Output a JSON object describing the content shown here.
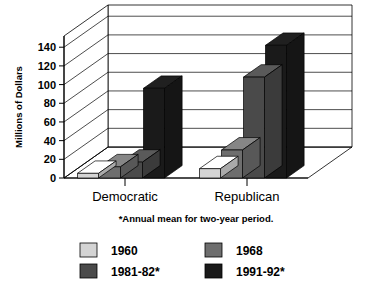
{
  "chart_data": {
    "type": "bar",
    "title": "",
    "subtitle": "",
    "xlabel": "",
    "ylabel": "Millions of Dollars",
    "ylim": [
      0,
      140
    ],
    "yticks": [
      0,
      20,
      40,
      60,
      80,
      100,
      120,
      140
    ],
    "ytick_labels": [
      "0",
      "20",
      "40",
      "60",
      "80",
      "100",
      "120",
      "140"
    ],
    "categories": [
      "Democratic",
      "Republican"
    ],
    "grid": true,
    "legend_position": "bottom",
    "style": "3d-perspective-column",
    "footnote": "*Annual mean for two-year period.",
    "series": [
      {
        "name": "1960",
        "color": "#d4d4d4",
        "values": [
          5,
          10
        ]
      },
      {
        "name": "1968",
        "color": "#6e6e6e",
        "values": [
          12,
          30
        ]
      },
      {
        "name": "1981-82*",
        "color": "#4a4a4a",
        "values": [
          17,
          108
        ]
      },
      {
        "name": "1991-92*",
        "color": "#1a1a1a",
        "values": [
          96,
          142
        ]
      }
    ]
  },
  "legend": {
    "items": [
      {
        "label": "1960",
        "color": "#d4d4d4"
      },
      {
        "label": "1968",
        "color": "#6e6e6e"
      },
      {
        "label": "1981-82*",
        "color": "#4a4a4a"
      },
      {
        "label": "1991-92*",
        "color": "#1a1a1a"
      }
    ]
  },
  "axes": {
    "y_title": "Millions of Dollars",
    "y_ticks": [
      "140",
      "120",
      "100",
      "80",
      "60",
      "40",
      "20",
      "0"
    ],
    "x_categories": [
      "Democratic",
      "Republican"
    ]
  },
  "notes": {
    "footnote": "*Annual mean for two-year period."
  }
}
